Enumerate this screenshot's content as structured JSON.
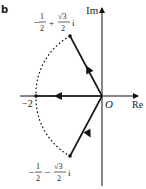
{
  "panel_label": "b",
  "axes": {
    "x_label": "Re",
    "y_label": "Im",
    "origin_label": "O"
  },
  "points": {
    "upper": {
      "real_sign": "−",
      "real_num": "1",
      "real_den": "2",
      "op": "+",
      "imag_num": "√3",
      "imag_den": "2",
      "unit": "i"
    },
    "lower": {
      "real_sign": "−",
      "real_num": "1",
      "real_den": "2",
      "op": "−",
      "imag_num": "√3",
      "imag_den": "2",
      "unit": "i"
    },
    "left": {
      "label": "−2"
    }
  },
  "colors": {
    "stroke": "#111111",
    "text": "#222222"
  }
}
